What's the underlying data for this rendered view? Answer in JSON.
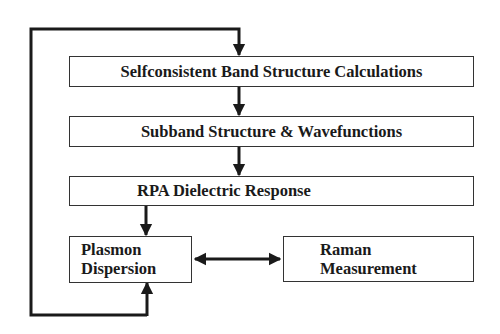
{
  "diagram": {
    "type": "flowchart",
    "nodes": [
      {
        "id": "band",
        "label": "Selfconsistent Band Structure Calculations"
      },
      {
        "id": "subband",
        "label": "Subband Structure & Wavefunctions"
      },
      {
        "id": "rpa",
        "label": "RPA Dielectric Response"
      },
      {
        "id": "plasmon",
        "label_line1": "Plasmon",
        "label_line2": "Dispersion"
      },
      {
        "id": "raman",
        "label_line1": "Raman",
        "label_line2": "Measurement"
      }
    ],
    "edges": [
      {
        "from": "band",
        "to": "subband",
        "type": "arrow"
      },
      {
        "from": "subband",
        "to": "rpa",
        "type": "arrow"
      },
      {
        "from": "rpa",
        "to": "plasmon",
        "type": "arrow"
      },
      {
        "from": "plasmon",
        "to": "raman",
        "type": "bidirectional"
      },
      {
        "from": "plasmon",
        "to": "band",
        "type": "feedback-loop"
      }
    ],
    "colors": {
      "line": "#1a1a1a",
      "box_border": "#333333",
      "background": "#ffffff"
    }
  }
}
